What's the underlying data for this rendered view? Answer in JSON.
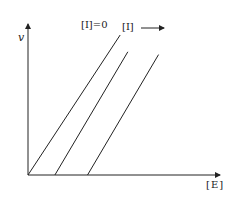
{
  "chart_data": {
    "type": "line",
    "title": "",
    "xlabel": "[E]",
    "ylabel": "v",
    "grid": false,
    "legend": null,
    "annotations": [
      {
        "text": "[I]=0",
        "target": "series 1"
      },
      {
        "text": "[I]",
        "arrow": "right",
        "meaning": "increasing inhibitor concentration"
      }
    ],
    "series": [
      {
        "name": "[I]=0",
        "x": [
          0,
          0.48
        ],
        "y": [
          0,
          1.0
        ]
      },
      {
        "name": "[I] medium",
        "x": [
          0.14,
          0.52
        ],
        "y": [
          0,
          0.88
        ]
      },
      {
        "name": "[I] high",
        "x": [
          0.31,
          0.68
        ],
        "y": [
          0,
          0.86
        ]
      }
    ],
    "xlim": [
      0,
      1
    ],
    "ylim": [
      0,
      1.1
    ],
    "colors": {
      "line": "#222222",
      "axis": "#222222",
      "background": "#ffffff"
    }
  },
  "labels": {
    "y_axis": "v",
    "x_axis": "[E]",
    "annotation_zero": "[I]=0",
    "annotation_increase": "[I]"
  }
}
